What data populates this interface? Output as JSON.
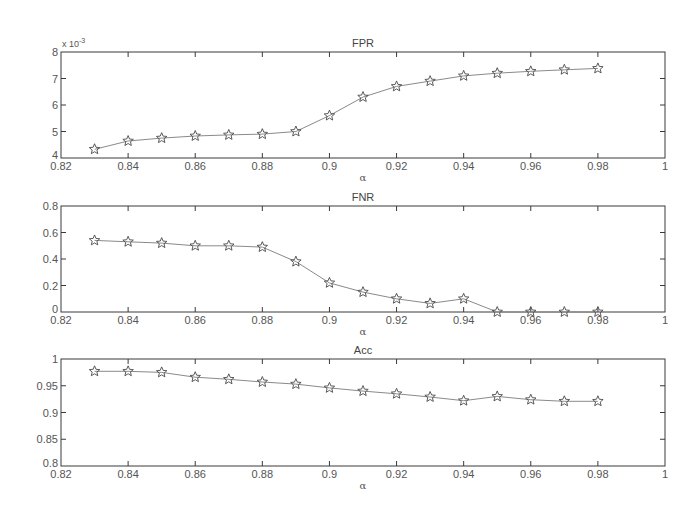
{
  "chart_data": [
    {
      "type": "line",
      "title": "FPR",
      "xlabel": "α",
      "ylabel": "",
      "y_exponent_label": "x 10",
      "y_exponent_power": "-3",
      "xlim": [
        0.82,
        1
      ],
      "ylim": [
        4,
        8
      ],
      "xticks": [
        0.82,
        0.84,
        0.86,
        0.88,
        0.9,
        0.92,
        0.94,
        0.96,
        0.98,
        1
      ],
      "xtick_labels": [
        "0.82",
        "0.84",
        "0.86",
        "0.88",
        "0.9",
        "0.92",
        "0.94",
        "0.96",
        "0.98",
        "1"
      ],
      "yticks": [
        4,
        5,
        6,
        7,
        8
      ],
      "ytick_labels": [
        "4",
        "5",
        "6",
        "7",
        "8"
      ],
      "grid": false,
      "marker": "star",
      "x": [
        0.83,
        0.84,
        0.85,
        0.86,
        0.87,
        0.88,
        0.89,
        0.9,
        0.91,
        0.92,
        0.93,
        0.94,
        0.95,
        0.96,
        0.97,
        0.98
      ],
      "series": [
        {
          "name": "FPR",
          "values": [
            4.33,
            4.64,
            4.75,
            4.83,
            4.87,
            4.9,
            5.0,
            5.6,
            6.3,
            6.7,
            6.9,
            7.1,
            7.2,
            7.27,
            7.33,
            7.38
          ]
        }
      ]
    },
    {
      "type": "line",
      "title": "FNR",
      "xlabel": "α",
      "ylabel": "",
      "xlim": [
        0.82,
        1
      ],
      "ylim": [
        0,
        0.8
      ],
      "xticks": [
        0.82,
        0.84,
        0.86,
        0.88,
        0.9,
        0.92,
        0.94,
        0.96,
        0.98,
        1
      ],
      "xtick_labels": [
        "0.82",
        "0.84",
        "0.86",
        "0.88",
        "0.9",
        "0.92",
        "0.94",
        "0.96",
        "0.98",
        "1"
      ],
      "yticks": [
        0,
        0.2,
        0.4,
        0.6,
        0.8
      ],
      "ytick_labels": [
        "0",
        "0.2",
        "0.4",
        "0.6",
        "0.8"
      ],
      "grid": false,
      "marker": "star",
      "x": [
        0.83,
        0.84,
        0.85,
        0.86,
        0.87,
        0.88,
        0.89,
        0.9,
        0.91,
        0.92,
        0.93,
        0.94,
        0.95,
        0.96,
        0.97,
        0.98
      ],
      "series": [
        {
          "name": "FNR",
          "values": [
            0.54,
            0.53,
            0.52,
            0.5,
            0.5,
            0.49,
            0.38,
            0.22,
            0.15,
            0.1,
            0.065,
            0.1,
            0.0,
            0.0,
            0.0,
            0.0
          ]
        }
      ]
    },
    {
      "type": "line",
      "title": "Acc",
      "xlabel": "α",
      "ylabel": "",
      "xlim": [
        0.82,
        1
      ],
      "ylim": [
        0.8,
        1
      ],
      "xticks": [
        0.82,
        0.84,
        0.86,
        0.88,
        0.9,
        0.92,
        0.94,
        0.96,
        0.98,
        1
      ],
      "xtick_labels": [
        "0.82",
        "0.84",
        "0.86",
        "0.88",
        "0.9",
        "0.92",
        "0.94",
        "0.96",
        "0.98",
        "1"
      ],
      "yticks": [
        0.8,
        0.85,
        0.9,
        0.95,
        1
      ],
      "ytick_labels": [
        "0.8",
        "0.85",
        "0.9",
        "0.95",
        "1"
      ],
      "grid": false,
      "marker": "star",
      "x": [
        0.83,
        0.84,
        0.85,
        0.86,
        0.87,
        0.88,
        0.89,
        0.9,
        0.91,
        0.92,
        0.93,
        0.94,
        0.95,
        0.96,
        0.97,
        0.98
      ],
      "series": [
        {
          "name": "Acc",
          "values": [
            0.977,
            0.977,
            0.975,
            0.966,
            0.962,
            0.957,
            0.953,
            0.946,
            0.94,
            0.935,
            0.929,
            0.922,
            0.93,
            0.924,
            0.921,
            0.921
          ]
        }
      ]
    }
  ]
}
